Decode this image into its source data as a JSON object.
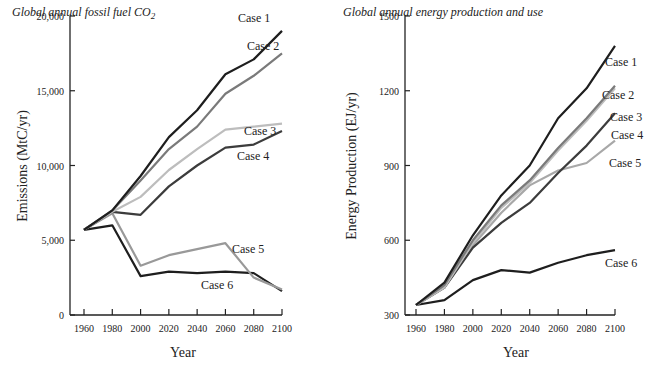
{
  "chart_data": [
    {
      "type": "line",
      "title": "Global annual fossil fuel CO2",
      "title_main": "Global annual fossil fuel CO",
      "title_sub": "2",
      "xlabel": "Year",
      "ylabel": "Emissions (MtC/yr)",
      "x": [
        1960,
        1980,
        2000,
        2020,
        2040,
        2060,
        2080,
        2100
      ],
      "x_ticks": [
        "1960",
        "1980",
        "2000",
        "2020",
        "2040",
        "2060",
        "2080",
        "2100"
      ],
      "y_ticks": [
        "0",
        "5,000",
        "10,000",
        "15,000",
        "20,000"
      ],
      "y_tick_values": [
        0,
        5000,
        10000,
        15000,
        20000
      ],
      "ylim": [
        0,
        20000
      ],
      "grid": false,
      "legend": "inline labels at line ends",
      "series": [
        {
          "name": "Case 1",
          "color": "#1e1e1e",
          "values": [
            5700,
            7000,
            9300,
            11900,
            13700,
            16100,
            17100,
            19000
          ]
        },
        {
          "name": "Case 2",
          "color": "#7a7a7a",
          "values": [
            5700,
            7000,
            9000,
            11100,
            12600,
            14800,
            16000,
            17500
          ]
        },
        {
          "name": "Case 3",
          "color": "#bdbdbd",
          "values": [
            5700,
            6900,
            7900,
            9700,
            11100,
            12400,
            12600,
            12800
          ]
        },
        {
          "name": "Case 4",
          "color": "#3c3c3c",
          "values": [
            5700,
            6900,
            6700,
            8600,
            10000,
            11200,
            11400,
            12300
          ]
        },
        {
          "name": "Case 5",
          "color": "#999999",
          "values": [
            5700,
            6800,
            3300,
            4000,
            4400,
            4800,
            2500,
            1700
          ]
        },
        {
          "name": "Case 6",
          "color": "#1e1e1e",
          "values": [
            5700,
            6000,
            2600,
            2900,
            2800,
            2900,
            2800,
            1600
          ]
        }
      ]
    },
    {
      "type": "line",
      "title": "Global annual energy production and use",
      "xlabel": "Year",
      "ylabel": "Energy Production (EJ/yr)",
      "x": [
        1960,
        1980,
        2000,
        2020,
        2040,
        2060,
        2080,
        2100
      ],
      "x_ticks": [
        "1960",
        "1980",
        "2000",
        "2020",
        "2040",
        "2060",
        "2080",
        "2100"
      ],
      "y_ticks": [
        "300",
        "600",
        "900",
        "1200",
        "1500"
      ],
      "y_tick_values": [
        300,
        600,
        900,
        1200,
        1500
      ],
      "ylim": [
        300,
        1500
      ],
      "grid": false,
      "legend": "inline labels at line ends",
      "series": [
        {
          "name": "Case 1",
          "color": "#1e1e1e",
          "values": [
            340,
            430,
            620,
            780,
            900,
            1090,
            1210,
            1380
          ]
        },
        {
          "name": "Case 2",
          "color": "#7a7a7a",
          "values": [
            340,
            420,
            600,
            740,
            840,
            970,
            1090,
            1220
          ]
        },
        {
          "name": "Case 3",
          "color": "#bdbdbd",
          "values": [
            340,
            410,
            590,
            730,
            830,
            960,
            1080,
            1210
          ]
        },
        {
          "name": "Case 4",
          "color": "#3c3c3c",
          "values": [
            340,
            410,
            570,
            670,
            750,
            870,
            980,
            1110
          ]
        },
        {
          "name": "Case 5",
          "color": "#a8a8a8",
          "values": [
            340,
            410,
            580,
            710,
            820,
            880,
            910,
            1000
          ]
        },
        {
          "name": "Case 6",
          "color": "#1e1e1e",
          "values": [
            340,
            360,
            440,
            480,
            470,
            510,
            540,
            560
          ]
        }
      ]
    }
  ],
  "labels": {
    "left": [
      {
        "text": "Case 1",
        "x": 238,
        "y": 22
      },
      {
        "text": "Case 2",
        "x": 247,
        "y": 50
      },
      {
        "text": "Case 3",
        "x": 244,
        "y": 135
      },
      {
        "text": "Case 4",
        "x": 237,
        "y": 160
      },
      {
        "text": "Case 5",
        "x": 232,
        "y": 253
      },
      {
        "text": "Case 6",
        "x": 201,
        "y": 289
      }
    ],
    "right": [
      {
        "text": "Case 1",
        "x": 605,
        "y": 66
      },
      {
        "text": "Case 2",
        "x": 602,
        "y": 99
      },
      {
        "text": "Case 3",
        "x": 610,
        "y": 121
      },
      {
        "text": "Case 4",
        "x": 611,
        "y": 139
      },
      {
        "text": "Case 5",
        "x": 609,
        "y": 167
      },
      {
        "text": "Case 6",
        "x": 605,
        "y": 267
      }
    ]
  }
}
